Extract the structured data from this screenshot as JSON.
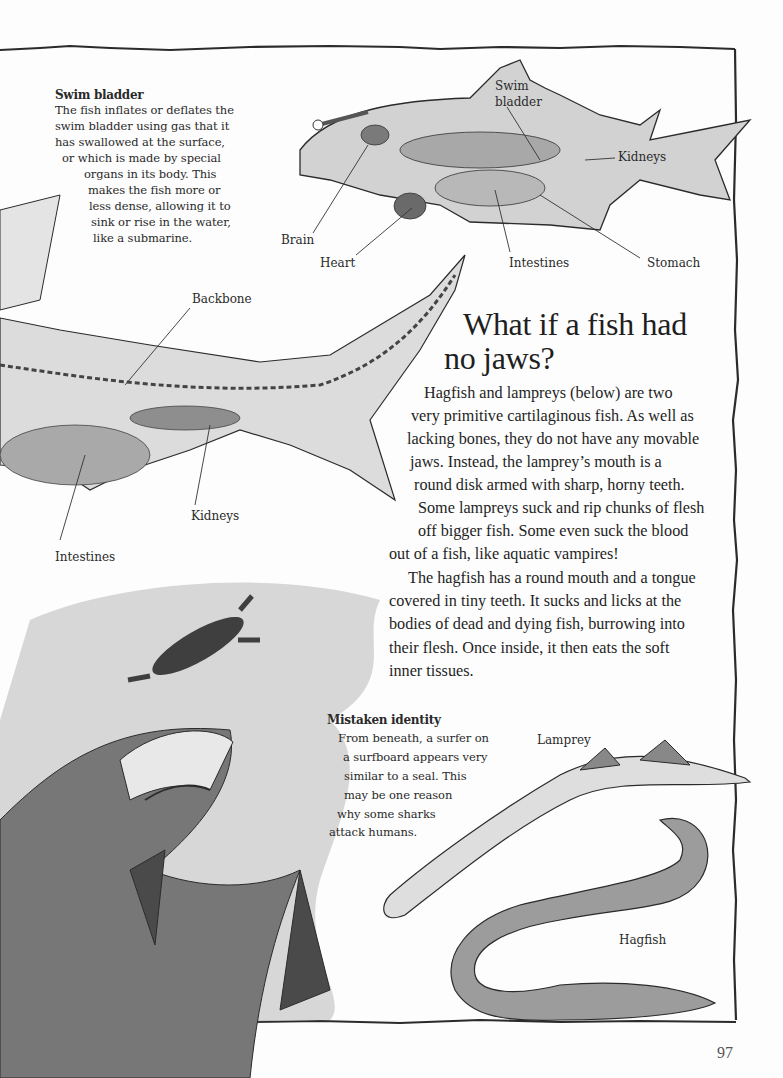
{
  "page_number": "97",
  "swim_bladder_box": {
    "title": "Swim bladder",
    "lines": [
      "The fish inflates or deflates the",
      "swim bladder using gas that it",
      "has swallowed at the surface,",
      "or which is made by special",
      "organs in its body. This",
      "makes the fish more or",
      "less dense, allowing it to",
      "sink or rise in the water,",
      "like a submarine."
    ]
  },
  "bony_fish_diagram": {
    "labels": {
      "swim_bladder": "Swim\nbladder",
      "kidneys": "Kidneys",
      "brain": "Brain",
      "heart": "Heart",
      "intestines": "Intestines",
      "stomach": "Stomach"
    }
  },
  "shark_diagram": {
    "labels": {
      "backbone": "Backbone",
      "kidneys": "Kidneys",
      "intestines": "Intestines"
    }
  },
  "article": {
    "heading_line1": "What if a fish had",
    "heading_line2": "no jaws?",
    "lines": [
      "Hagfish and lampreys (below) are two",
      "very primitive cartilaginous fish. As well as",
      "lacking bones, they do not have any movable",
      "jaws. Instead, the lamprey’s mouth is a",
      "round disk armed with sharp, horny teeth.",
      "Some lampreys suck and rip chunks of flesh",
      "off bigger fish. Some even suck the blood",
      "out of a fish, like aquatic vampires!",
      "The hagfish has a round mouth and a tongue",
      "covered in tiny teeth. It sucks and licks at the",
      "bodies of dead and dying fish, burrowing into",
      "their flesh. Once inside, it then eats the soft",
      "inner tissues."
    ]
  },
  "mistaken_identity_box": {
    "title": "Mistaken identity",
    "lines": [
      "From beneath, a surfer on",
      "a surfboard appears very",
      "similar to a seal. This",
      "may be one reason",
      "why some sharks",
      "attack humans."
    ]
  },
  "eel_labels": {
    "lamprey": "Lamprey",
    "hagfish": "Hagfish"
  }
}
